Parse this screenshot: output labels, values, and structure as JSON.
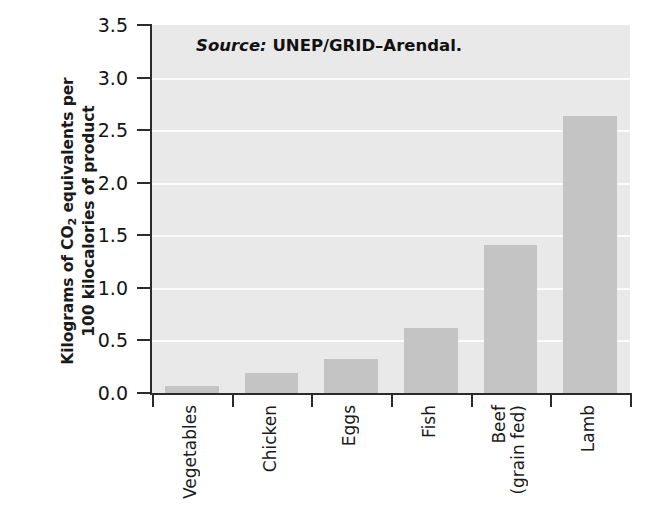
{
  "chart_data": {
    "type": "bar",
    "title": "",
    "subtitle": "",
    "xlabel": "",
    "ylabel_line1": "Kilograms of CO2 equivalents per",
    "ylabel_line2": "100 kilocalories of product",
    "categories": [
      "Vegetables",
      "Chicken",
      "Eggs",
      "Fish",
      "Beef (grain fed)",
      "Lamb"
    ],
    "category_lines": [
      [
        "Vegetables"
      ],
      [
        "Chicken"
      ],
      [
        "Eggs"
      ],
      [
        "Fish"
      ],
      [
        "Beef",
        "(grain fed)"
      ],
      [
        "Lamb"
      ]
    ],
    "values": [
      0.07,
      0.19,
      0.32,
      0.62,
      1.41,
      2.63
    ],
    "ylim": [
      0.0,
      3.5
    ],
    "yticks": [
      0.0,
      0.5,
      1.0,
      1.5,
      2.0,
      2.5,
      3.0,
      3.5
    ],
    "ytick_labels": [
      "0.0",
      "0.5",
      "1.0",
      "1.5",
      "2.0",
      "2.5",
      "3.0",
      "3.5"
    ],
    "grid": true,
    "grid_axis": "y",
    "legend": false,
    "legend_position": "none",
    "bar_color": "#c4c4c4",
    "plot_background": "#e9e9e9",
    "gridline_color": "#fbfbfb",
    "axis_color": "#2b2b2b",
    "annotations": [
      {
        "name": "source-note",
        "key": "Source:",
        "value": "UNEP/GRID–Arendal."
      }
    ]
  },
  "axis": {
    "y_title_prefix": "Kilograms of CO",
    "y_title_subscript": "2",
    "y_title_suffix": " equivalents per",
    "y_title_line2": "100 kilocalories of product"
  }
}
